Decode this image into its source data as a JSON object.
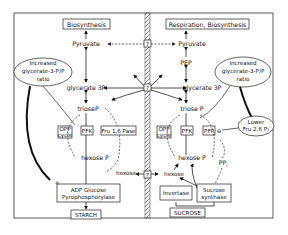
{
  "diagram": {
    "left": {
      "top_box": "Biosynthesis",
      "pyruvate": "Pyruvate",
      "ellipse": [
        "Increased",
        "glycerate-3-P/P",
        "ratio"
      ],
      "glycerate": "glycerate 3P",
      "triose": "trioseP",
      "opp": [
        "OPP",
        "cycle"
      ],
      "pfk": "PFK",
      "fru_pase": "Fru 1,6 Pase",
      "hexose_p": "hexose P",
      "hexose_in": "hexose",
      "adp_box": [
        "ADP Glucose",
        "Pyrophosphorylase"
      ],
      "starch": "STARCH",
      "plus": "+"
    },
    "right": {
      "top_box": "Respiration, Biosynthesis",
      "pyruvate": "Pyruvate",
      "pep": "PEP",
      "ellipse": [
        "Increased",
        "glycerate-3-P/P",
        "ratio"
      ],
      "glycerate": "glycerate 3P",
      "triose": "triose P",
      "lower_ellipse": [
        "Lower",
        "Fru 2,6 P₂"
      ],
      "opp": [
        "OPP",
        "cycle"
      ],
      "pfk": "PFK",
      "pfp": "PFP",
      "hexose_p": "hexose  P",
      "ppi": "PP",
      "ppi_sub": "i",
      "hexose": "hexose",
      "invertase": "Invertase",
      "sucrose_synthase": [
        "Sucrose",
        "synthase"
      ],
      "sucrose": "SUCROSE"
    },
    "membrane": {
      "transporter_label": "?"
    },
    "inhibit_symbol": "⊖"
  }
}
